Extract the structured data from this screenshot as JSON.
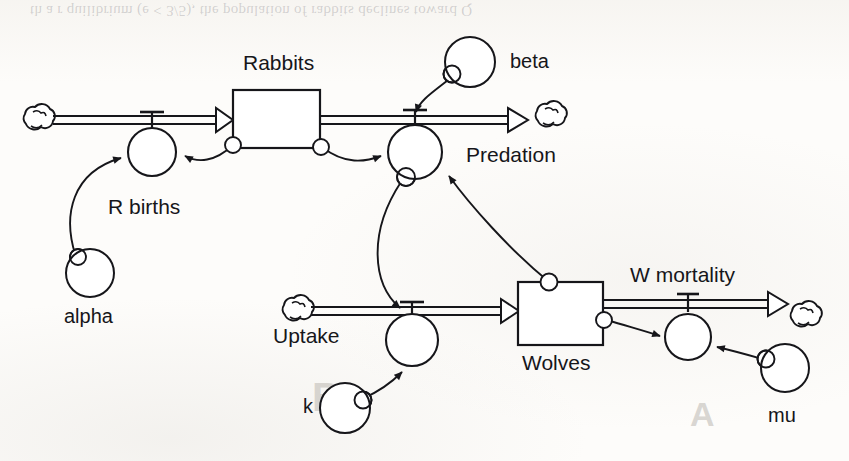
{
  "figure": {
    "type": "system-dynamics-stock-flow-diagram",
    "width": 849,
    "height": 461,
    "background_color": "#fdfcfa",
    "ink_color": "#16161a"
  },
  "bleed_through": {
    "top_text": "th a  r   quilibrium (e < 3/5), the population of rabbits declines toward Q",
    "mid_text_left": "B",
    "mid_text_right": "A"
  },
  "stocks": [
    {
      "id": "rabbits",
      "label": "Rabbits",
      "x": 233,
      "y": 90,
      "w": 87,
      "h": 58,
      "label_x": 243,
      "label_y": 57
    },
    {
      "id": "wolves",
      "label": "Wolves",
      "x": 518,
      "y": 282,
      "w": 85,
      "h": 63,
      "label_x": 522,
      "label_y": 358
    }
  ],
  "flows": [
    {
      "id": "r-births-flow",
      "label": "R births",
      "valve_label_x": 108,
      "valve_label_y": 200,
      "from": "cloud-left",
      "to": "rabbits"
    },
    {
      "id": "predation-flow",
      "label": "Predation",
      "valve_label_x": 466,
      "valve_label_y": 148,
      "from": "rabbits",
      "to": "cloud-right"
    },
    {
      "id": "uptake-flow",
      "label": "Uptake",
      "valve_label_x": 275,
      "valve_label_y": 328,
      "from": "cloud-uptake",
      "to": "wolves"
    },
    {
      "id": "w-mortality-flow",
      "label": "W mortality",
      "valve_label_x": 630,
      "valve_label_y": 268,
      "from": "wolves",
      "to": "cloud-far-right"
    }
  ],
  "valves": [
    {
      "id": "r-births-valve",
      "cx": 152,
      "cy": 152,
      "r": 24
    },
    {
      "id": "predation-valve",
      "cx": 415,
      "cy": 152,
      "r": 27
    },
    {
      "id": "uptake-valve",
      "cx": 412,
      "cy": 340,
      "r": 26
    },
    {
      "id": "w-mortality-valve",
      "cx": 688,
      "cy": 337,
      "r": 23
    }
  ],
  "converters": [
    {
      "id": "alpha",
      "label": "alpha",
      "cx": 90,
      "cy": 273,
      "r": 24,
      "label_x": 64,
      "label_y": 330
    },
    {
      "id": "beta",
      "label": "beta",
      "cx": 470,
      "cy": 62,
      "r": 25,
      "label_x": 510,
      "label_y": 57
    },
    {
      "id": "k",
      "label": "k",
      "cx": 345,
      "cy": 408,
      "r": 25,
      "label_x": 303,
      "label_y": 400
    },
    {
      "id": "mu",
      "label": "mu",
      "cx": 785,
      "cy": 368,
      "r": 24,
      "label_x": 770,
      "label_y": 412
    }
  ],
  "clouds": [
    {
      "id": "cloud-left",
      "cx": 38,
      "cy": 121
    },
    {
      "id": "cloud-right",
      "cx": 550,
      "cy": 118
    },
    {
      "id": "cloud-uptake",
      "cx": 297,
      "cy": 312
    },
    {
      "id": "cloud-far-right",
      "cx": 805,
      "cy": 318
    }
  ],
  "connectors": [
    {
      "id": "alpha-to-r-births",
      "from": "alpha",
      "to": "r-births-valve"
    },
    {
      "id": "rabbits-to-r-births",
      "from": "rabbits",
      "to": "r-births-valve"
    },
    {
      "id": "rabbits-to-predation",
      "from": "rabbits",
      "to": "predation-valve"
    },
    {
      "id": "beta-to-predation",
      "from": "beta",
      "to": "predation-valve"
    },
    {
      "id": "wolves-to-predation",
      "from": "wolves",
      "to": "predation-valve"
    },
    {
      "id": "predation-to-uptake",
      "from": "predation-valve",
      "to": "uptake-valve"
    },
    {
      "id": "k-to-uptake",
      "from": "k",
      "to": "uptake-valve"
    },
    {
      "id": "wolves-to-w-mortality",
      "from": "wolves",
      "to": "w-mortality-valve"
    },
    {
      "id": "mu-to-w-mortality",
      "from": "mu",
      "to": "w-mortality-valve"
    }
  ]
}
